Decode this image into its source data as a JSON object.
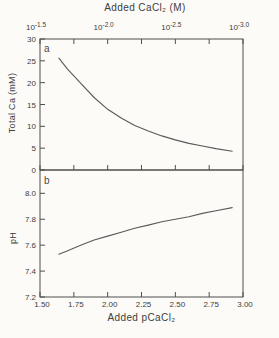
{
  "figure": {
    "background": "#fcfbf8",
    "axis_color": "#4f4f4f",
    "curve_color": "#5a5a5a",
    "text_color": "#3d3d3d",
    "top_axis_title": "Added CaCl₂ (M)",
    "bottom_axis_title": "Added pCaCl₂"
  },
  "chart_data": [
    {
      "type": "line",
      "panel_label": "a",
      "ylabel": "Total Ca (mM)",
      "xlabel": "Added pCaCl₂",
      "xlim": [
        1.5,
        3.0
      ],
      "ylim": [
        0,
        30
      ],
      "grid": false,
      "legend": "none",
      "yticks": [
        0,
        5,
        10,
        15,
        20,
        25,
        30
      ],
      "ytick_labels": [
        "0",
        "5",
        "10",
        "15",
        "20",
        "25",
        "30"
      ],
      "top_axis": {
        "title": "Added CaCl₂ (M)",
        "scale": "log",
        "major_ticks": [
          {
            "x": 1.5,
            "mantissa": "10",
            "exponent": "-1.5"
          },
          {
            "x": 2.0,
            "mantissa": "10",
            "exponent": "-2.0"
          },
          {
            "x": 2.5,
            "mantissa": "10",
            "exponent": "-2.5"
          },
          {
            "x": 3.0,
            "mantissa": "10",
            "exponent": "-3.0"
          }
        ],
        "minor_tick_xs": [
          1.75,
          2.25,
          2.75
        ]
      },
      "series": [
        {
          "name": "Total Ca",
          "x": [
            1.64,
            1.7,
            1.8,
            1.9,
            2.0,
            2.1,
            2.2,
            2.3,
            2.4,
            2.5,
            2.6,
            2.7,
            2.8,
            2.92
          ],
          "y": [
            25.6,
            23.2,
            19.9,
            16.6,
            13.9,
            11.9,
            10.2,
            8.9,
            7.8,
            6.9,
            6.1,
            5.5,
            4.9,
            4.3
          ]
        }
      ]
    },
    {
      "type": "line",
      "panel_label": "b",
      "ylabel": "pH",
      "xlabel": "Added pCaCl₂",
      "xlim": [
        1.5,
        3.0
      ],
      "ylim": [
        7.2,
        8.18
      ],
      "grid": false,
      "legend": "none",
      "yticks": [
        7.2,
        7.4,
        7.6,
        7.8,
        8.0
      ],
      "ytick_labels": [
        "7.2",
        "7.4",
        "7.6",
        "7.8",
        "8.0"
      ],
      "bottom_axis": {
        "title": "Added pCaCl₂",
        "tick_values": [
          1.5,
          1.75,
          2.0,
          2.25,
          2.5,
          2.75,
          3.0
        ],
        "tick_labels": [
          "1.50",
          "1.75",
          "2.00",
          "2.25",
          "2.50",
          "2.75",
          "3.00"
        ]
      },
      "series": [
        {
          "name": "pH",
          "x": [
            1.64,
            1.7,
            1.8,
            1.9,
            2.0,
            2.1,
            2.2,
            2.3,
            2.4,
            2.5,
            2.6,
            2.7,
            2.8,
            2.92
          ],
          "y": [
            7.53,
            7.555,
            7.6,
            7.64,
            7.67,
            7.7,
            7.73,
            7.755,
            7.78,
            7.8,
            7.82,
            7.845,
            7.865,
            7.89
          ]
        }
      ]
    }
  ]
}
